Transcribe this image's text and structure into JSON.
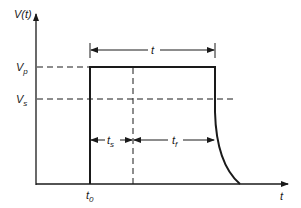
{
  "diagram": {
    "type": "pulse-waveform",
    "axes": {
      "y_label": "V(t)",
      "x_label": "t"
    },
    "levels": [
      {
        "name": "V",
        "sub": "p",
        "description": "pulse voltage"
      },
      {
        "name": "V",
        "sub": "s",
        "description": "threshold voltage"
      }
    ],
    "time_markers": [
      {
        "name": "t",
        "sub": "0"
      }
    ],
    "intervals": [
      {
        "label": "t",
        "sub": "",
        "description": "pulse duration"
      },
      {
        "label": "t",
        "sub": "s"
      },
      {
        "label": "t",
        "sub": "f"
      }
    ],
    "colors": {
      "line": "#1a1a1a",
      "dashed": "#1a1a1a"
    }
  }
}
